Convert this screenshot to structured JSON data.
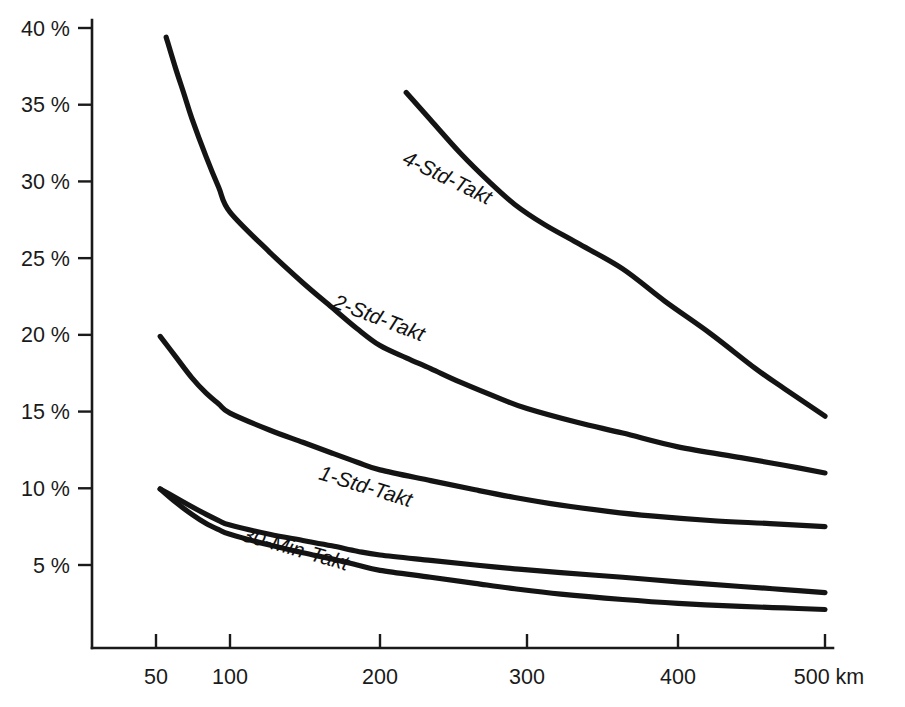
{
  "chart_data": {
    "type": "line",
    "title": "",
    "subtitle": "",
    "xlabel": "",
    "ylabel": "",
    "x_unit": "km",
    "x_scale": "log",
    "y_scale": "linear",
    "grid": false,
    "legend_position": "inline-on-curve",
    "xlim": [
      40,
      520
    ],
    "ylim": [
      0,
      41
    ],
    "x_ticks": [
      {
        "value": 50,
        "label": "50"
      },
      {
        "value": 100,
        "label": "100"
      },
      {
        "value": 200,
        "label": "200"
      },
      {
        "value": 300,
        "label": "300"
      },
      {
        "value": 400,
        "label": "400"
      },
      {
        "value": 500,
        "label": "500 km"
      }
    ],
    "y_ticks": [
      {
        "value": 5,
        "label": "5 %"
      },
      {
        "value": 10,
        "label": "10 %"
      },
      {
        "value": 15,
        "label": "15 %"
      },
      {
        "value": 20,
        "label": "20 %"
      },
      {
        "value": 25,
        "label": "25 %"
      },
      {
        "value": 30,
        "label": "30 %"
      },
      {
        "value": 35,
        "label": "35 %"
      },
      {
        "value": 40,
        "label": "40 %"
      }
    ],
    "series": [
      {
        "name": "4-Std-Takt",
        "label": "4-Std-Takt",
        "label_rotation": 26,
        "label_anchor": {
          "x": 212,
          "y": 31.2
        },
        "x": [
          55,
          60,
          65,
          70,
          80,
          90,
          100,
          120,
          140,
          160,
          180,
          200,
          215,
          230,
          250,
          280,
          300,
          330,
          360,
          400,
          440,
          470,
          500
        ],
        "y": [
          39.4,
          37.4,
          35.7,
          34.1,
          31.6,
          29.6,
          28.0,
          25.4,
          23.4,
          21.8,
          20.4,
          19.3,
          18.5,
          17.8,
          16.9,
          15.8,
          15.2,
          14.3,
          13.6,
          12.7,
          12.0,
          11.5,
          11.0
        ]
      },
      {
        "name": "4-Std-Takt-upper",
        "label": "",
        "label_rotation": 0,
        "label_anchor": null,
        "x": [
          215,
          230,
          250,
          270,
          290,
          310,
          330,
          360,
          390,
          420,
          450,
          470,
          500
        ],
        "y": [
          35.8,
          34.0,
          31.8,
          30.0,
          28.5,
          27.2,
          26.0,
          24.3,
          22.2,
          20.1,
          17.8,
          16.5,
          14.7
        ]
      },
      {
        "name": "2-Std-Takt",
        "label": "2-Std-Takt",
        "label_rotation": 21,
        "label_anchor": {
          "x": 160,
          "y": 21.8
        },
        "x": [
          52,
          60,
          70,
          80,
          90,
          100,
          120,
          140,
          160,
          180,
          200,
          230,
          260,
          290,
          320,
          350,
          380,
          420,
          460,
          500
        ],
        "y": [
          19.9,
          18.6,
          17.2,
          16.2,
          15.5,
          14.9,
          13.8,
          13.0,
          12.3,
          11.7,
          11.2,
          10.5,
          9.9,
          9.4,
          8.9,
          8.5,
          8.2,
          7.9,
          7.7,
          7.5
        ]
      },
      {
        "name": "1-Std-Takt",
        "label": "1-Std-Takt",
        "label_rotation": 17,
        "label_anchor": {
          "x": 150,
          "y": 10.6
        },
        "x": [
          52,
          60,
          70,
          80,
          90,
          100,
          120,
          140,
          160,
          180,
          200,
          230,
          260,
          290,
          320,
          360,
          400,
          440,
          470,
          500
        ],
        "y": [
          9.95,
          9.4,
          8.8,
          8.3,
          7.9,
          7.6,
          7.0,
          6.6,
          6.25,
          5.9,
          5.65,
          5.3,
          5.0,
          4.75,
          4.5,
          4.2,
          3.9,
          3.6,
          3.4,
          3.2
        ]
      },
      {
        "name": "30-Min-Takt",
        "label": "30-Min-Takt",
        "label_rotation": 16,
        "label_anchor": {
          "x": 105,
          "y": 6.6
        },
        "x": [
          52,
          60,
          70,
          80,
          90,
          100,
          120,
          140,
          160,
          180,
          200,
          230,
          260,
          290,
          320,
          360,
          400,
          440,
          470,
          500
        ],
        "y": [
          9.95,
          9.1,
          8.3,
          7.7,
          7.3,
          7.0,
          6.3,
          5.8,
          5.4,
          5.0,
          4.65,
          4.2,
          3.8,
          3.45,
          3.1,
          2.75,
          2.5,
          2.3,
          2.2,
          2.1
        ]
      }
    ]
  },
  "axes": {
    "y_axis_name": "percentage-axis",
    "x_axis_name": "distance-axis"
  }
}
